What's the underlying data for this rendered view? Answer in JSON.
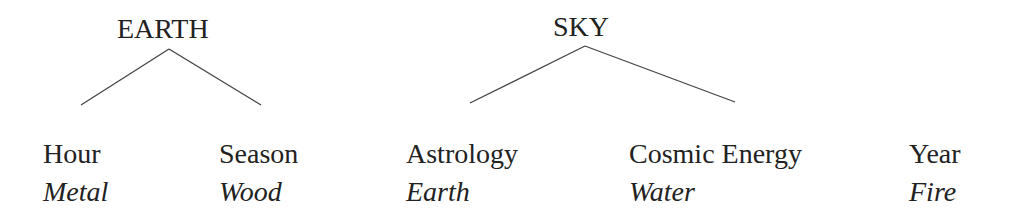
{
  "roots": [
    {
      "label": "EARTH",
      "children": [
        {
          "label": "Hour",
          "element": "Metal"
        },
        {
          "label": "Season",
          "element": "Wood"
        }
      ]
    },
    {
      "label": "SKY",
      "children": [
        {
          "label": "Astrology",
          "element": "Earth"
        },
        {
          "label": "Cosmic Energy",
          "element": "Water"
        }
      ]
    }
  ],
  "standalone": {
    "label": "Year",
    "element": "Fire"
  }
}
